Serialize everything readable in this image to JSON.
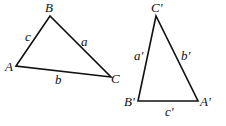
{
  "diagram": {
    "type": "geometry",
    "triangles": [
      {
        "id": "ABC",
        "vertices": {
          "A": {
            "label": "A",
            "x": 16,
            "y": 66
          },
          "B": {
            "label": "B",
            "x": 50,
            "y": 16
          },
          "C": {
            "label": "C",
            "x": 111,
            "y": 77
          }
        },
        "sides": {
          "a": {
            "label": "a",
            "between": [
              "B",
              "C"
            ]
          },
          "b": {
            "label": "b",
            "between": [
              "A",
              "C"
            ]
          },
          "c": {
            "label": "c",
            "between": [
              "A",
              "B"
            ]
          }
        }
      },
      {
        "id": "A'B'C'",
        "vertices": {
          "A": {
            "label": "A'",
            "x": 198,
            "y": 101
          },
          "B": {
            "label": "B'",
            "x": 138,
            "y": 101
          },
          "C": {
            "label": "C'",
            "x": 156,
            "y": 16
          }
        },
        "sides": {
          "a": {
            "label": "a'",
            "between": [
              "B'",
              "C'"
            ]
          },
          "b": {
            "label": "b'",
            "between": [
              "A'",
              "C'"
            ]
          },
          "c": {
            "label": "c'",
            "between": [
              "A'",
              "B'"
            ]
          }
        }
      }
    ],
    "colors": {
      "stroke": "#111111",
      "background": "#ffffff"
    }
  }
}
